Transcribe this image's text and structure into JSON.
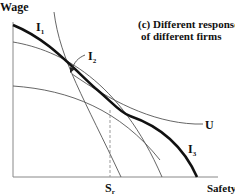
{
  "figure": {
    "title_line1": "(c) Different response",
    "title_line2": "of different firms",
    "axes": {
      "y_label": "Wage",
      "x_label": "Safety",
      "x_marker": "S",
      "x_marker_sub": "r"
    },
    "curves": {
      "i1": {
        "label": "I",
        "sub": "1"
      },
      "i2": {
        "label": "I",
        "sub": "2"
      },
      "i3": {
        "label": "I",
        "sub": "3"
      },
      "u": {
        "label": "U"
      }
    },
    "colors": {
      "line": "#111111",
      "thin": "#555555",
      "axis": "#888888"
    }
  }
}
